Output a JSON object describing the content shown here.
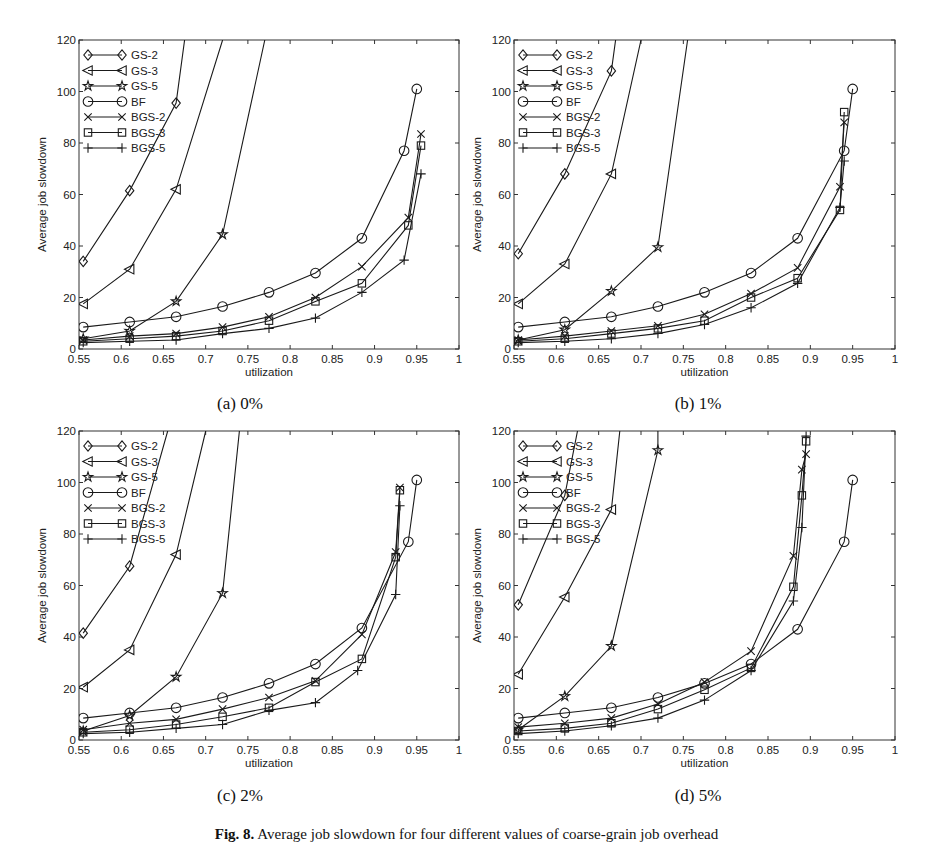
{
  "figure": {
    "caption_label": "Fig. 8.",
    "caption_text": "Average job slowdown for four different values of coarse-grain job overhead"
  },
  "chart_data": [
    {
      "type": "line",
      "panel": "a",
      "subcaption": "(a) 0%",
      "xlabel": "utilization",
      "ylabel": "Average job slowdown",
      "xlim": [
        0.55,
        1
      ],
      "ylim": [
        0,
        120
      ],
      "xticks": [
        0.55,
        0.6,
        0.65,
        0.7,
        0.75,
        0.8,
        0.85,
        0.9,
        0.95,
        1
      ],
      "yticks": [
        0,
        20,
        40,
        60,
        80,
        100,
        120
      ],
      "grid": false,
      "legend_position": "upper left",
      "series": [
        {
          "name": "GS-2",
          "marker": "diamond",
          "x": [
            0.555,
            0.61,
            0.665,
            0.675
          ],
          "y": [
            34,
            61.5,
            95.5,
            120
          ]
        },
        {
          "name": "GS-3",
          "marker": "triangle-left",
          "x": [
            0.555,
            0.61,
            0.665,
            0.72
          ],
          "y": [
            17.5,
            31,
            62,
            120
          ]
        },
        {
          "name": "GS-5",
          "marker": "star",
          "x": [
            0.555,
            0.61,
            0.665,
            0.72,
            0.77
          ],
          "y": [
            4,
            7,
            18.5,
            44.5,
            120
          ]
        },
        {
          "name": "BF",
          "marker": "circle",
          "x": [
            0.555,
            0.61,
            0.665,
            0.72,
            0.775,
            0.83,
            0.885,
            0.935,
            0.95
          ],
          "y": [
            8.5,
            10.5,
            12.5,
            16.5,
            22,
            29.5,
            43,
            77,
            101
          ]
        },
        {
          "name": "BGS-2",
          "marker": "x",
          "x": [
            0.555,
            0.61,
            0.665,
            0.72,
            0.775,
            0.83,
            0.885,
            0.94,
            0.955
          ],
          "y": [
            3.5,
            5,
            6,
            8.5,
            12.5,
            20,
            32,
            51,
            83.5
          ]
        },
        {
          "name": "BGS-3",
          "marker": "square",
          "x": [
            0.555,
            0.61,
            0.665,
            0.72,
            0.775,
            0.83,
            0.885,
            0.94,
            0.955
          ],
          "y": [
            3,
            4,
            5,
            7,
            11,
            18.5,
            25.5,
            48,
            79
          ]
        },
        {
          "name": "BGS-5",
          "marker": "plus",
          "x": [
            0.555,
            0.61,
            0.665,
            0.72,
            0.775,
            0.83,
            0.885,
            0.935,
            0.955
          ],
          "y": [
            2.5,
            3,
            3.5,
            6,
            8,
            12,
            22,
            34.5,
            68
          ]
        }
      ]
    },
    {
      "type": "line",
      "panel": "b",
      "subcaption": "(b) 1%",
      "xlabel": "utilization",
      "ylabel": "Average job slowdown",
      "xlim": [
        0.55,
        1
      ],
      "ylim": [
        0,
        120
      ],
      "xticks": [
        0.55,
        0.6,
        0.65,
        0.7,
        0.75,
        0.8,
        0.85,
        0.9,
        0.95,
        1
      ],
      "yticks": [
        0,
        20,
        40,
        60,
        80,
        100,
        120
      ],
      "grid": false,
      "legend_position": "upper left",
      "series": [
        {
          "name": "GS-2",
          "marker": "diamond",
          "x": [
            0.555,
            0.61,
            0.665,
            0.67
          ],
          "y": [
            37,
            68,
            108,
            120
          ]
        },
        {
          "name": "GS-3",
          "marker": "triangle-left",
          "x": [
            0.555,
            0.61,
            0.665,
            0.7
          ],
          "y": [
            17.5,
            33,
            68,
            120
          ]
        },
        {
          "name": "GS-5",
          "marker": "star",
          "x": [
            0.555,
            0.61,
            0.665,
            0.72,
            0.755
          ],
          "y": [
            3.5,
            7.5,
            22.5,
            39.5,
            120
          ]
        },
        {
          "name": "BF",
          "marker": "circle",
          "x": [
            0.555,
            0.61,
            0.665,
            0.72,
            0.775,
            0.83,
            0.885,
            0.94,
            0.95
          ],
          "y": [
            8.5,
            10.5,
            12.5,
            16.5,
            22,
            29.5,
            43,
            77,
            101
          ]
        },
        {
          "name": "BGS-2",
          "marker": "x",
          "x": [
            0.555,
            0.61,
            0.665,
            0.72,
            0.775,
            0.83,
            0.885,
            0.935,
            0.94
          ],
          "y": [
            3.5,
            5,
            7,
            9,
            13.5,
            21.5,
            31.5,
            63,
            88
          ]
        },
        {
          "name": "BGS-3",
          "marker": "square",
          "x": [
            0.555,
            0.61,
            0.665,
            0.72,
            0.775,
            0.83,
            0.885,
            0.935,
            0.94
          ],
          "y": [
            3,
            4,
            6,
            8,
            11,
            20,
            27.5,
            54,
            92
          ]
        },
        {
          "name": "BGS-5",
          "marker": "plus",
          "x": [
            0.555,
            0.61,
            0.665,
            0.72,
            0.775,
            0.83,
            0.885,
            0.935,
            0.94
          ],
          "y": [
            2.5,
            3,
            4,
            6,
            9.5,
            16,
            25.5,
            55,
            73
          ]
        }
      ]
    },
    {
      "type": "line",
      "panel": "c",
      "subcaption": "(c) 2%",
      "xlabel": "utilization",
      "ylabel": "Average job slowdown",
      "xlim": [
        0.55,
        1
      ],
      "ylim": [
        0,
        120
      ],
      "xticks": [
        0.55,
        0.6,
        0.65,
        0.7,
        0.75,
        0.8,
        0.85,
        0.9,
        0.95,
        1
      ],
      "yticks": [
        0,
        20,
        40,
        60,
        80,
        100,
        120
      ],
      "grid": false,
      "legend_position": "upper left",
      "series": [
        {
          "name": "GS-2",
          "marker": "diamond",
          "x": [
            0.555,
            0.61,
            0.655
          ],
          "y": [
            41.5,
            67.5,
            120
          ]
        },
        {
          "name": "GS-3",
          "marker": "triangle-left",
          "x": [
            0.555,
            0.61,
            0.665,
            0.7
          ],
          "y": [
            20.5,
            35,
            72,
            120
          ]
        },
        {
          "name": "GS-5",
          "marker": "star",
          "x": [
            0.555,
            0.61,
            0.665,
            0.72,
            0.74
          ],
          "y": [
            3.5,
            9.5,
            24.5,
            57,
            120
          ]
        },
        {
          "name": "BF",
          "marker": "circle",
          "x": [
            0.555,
            0.61,
            0.665,
            0.72,
            0.775,
            0.83,
            0.885,
            0.94,
            0.95
          ],
          "y": [
            8.5,
            10.5,
            12.5,
            16.5,
            22,
            29.5,
            43.5,
            77,
            101
          ]
        },
        {
          "name": "BGS-2",
          "marker": "x",
          "x": [
            0.555,
            0.61,
            0.665,
            0.72,
            0.775,
            0.83,
            0.885,
            0.925,
            0.93
          ],
          "y": [
            4,
            6.5,
            8,
            12,
            16.5,
            23,
            41,
            73,
            98
          ]
        },
        {
          "name": "BGS-3",
          "marker": "square",
          "x": [
            0.555,
            0.61,
            0.665,
            0.72,
            0.775,
            0.83,
            0.885,
            0.925,
            0.93
          ],
          "y": [
            3,
            4,
            6,
            9,
            12.5,
            22.5,
            31.5,
            71,
            97
          ]
        },
        {
          "name": "BGS-5",
          "marker": "plus",
          "x": [
            0.555,
            0.61,
            0.665,
            0.72,
            0.775,
            0.83,
            0.88,
            0.925,
            0.93
          ],
          "y": [
            2.5,
            3,
            4.5,
            6,
            11.5,
            14.5,
            27,
            56.5,
            91
          ]
        }
      ]
    },
    {
      "type": "line",
      "panel": "d",
      "subcaption": "(d) 5%",
      "xlabel": "utilization",
      "ylabel": "Average job slowdown",
      "xlim": [
        0.55,
        1
      ],
      "ylim": [
        0,
        120
      ],
      "xticks": [
        0.55,
        0.6,
        0.65,
        0.7,
        0.75,
        0.8,
        0.85,
        0.9,
        0.95,
        1
      ],
      "yticks": [
        0,
        20,
        40,
        60,
        80,
        100,
        120
      ],
      "grid": false,
      "legend_position": "upper left",
      "series": [
        {
          "name": "GS-2",
          "marker": "diamond",
          "x": [
            0.555,
            0.61,
            0.625
          ],
          "y": [
            52.5,
            95,
            120
          ]
        },
        {
          "name": "GS-3",
          "marker": "triangle-left",
          "x": [
            0.555,
            0.61,
            0.665,
            0.675
          ],
          "y": [
            25.5,
            55.5,
            89.5,
            120
          ]
        },
        {
          "name": "GS-5",
          "marker": "star",
          "x": [
            0.555,
            0.61,
            0.665,
            0.72,
            0.72
          ],
          "y": [
            4,
            17,
            36.5,
            112.5,
            120
          ]
        },
        {
          "name": "BF",
          "marker": "circle",
          "x": [
            0.555,
            0.61,
            0.665,
            0.72,
            0.775,
            0.83,
            0.885,
            0.94,
            0.95
          ],
          "y": [
            8.5,
            10.5,
            12.5,
            16.5,
            22,
            29.5,
            43,
            77,
            101
          ]
        },
        {
          "name": "BGS-2",
          "marker": "x",
          "x": [
            0.555,
            0.61,
            0.665,
            0.72,
            0.775,
            0.83,
            0.88,
            0.89,
            0.895
          ],
          "y": [
            5,
            6.5,
            8.5,
            14,
            22.5,
            34.5,
            71.5,
            105,
            111
          ]
        },
        {
          "name": "BGS-3",
          "marker": "square",
          "x": [
            0.555,
            0.61,
            0.665,
            0.72,
            0.775,
            0.83,
            0.88,
            0.89,
            0.895
          ],
          "y": [
            3.5,
            4.5,
            6.5,
            12,
            19.5,
            28,
            59.5,
            95,
            116
          ]
        },
        {
          "name": "BGS-5",
          "marker": "plus",
          "x": [
            0.555,
            0.61,
            0.665,
            0.72,
            0.775,
            0.83,
            0.88,
            0.89,
            0.895
          ],
          "y": [
            2.5,
            3.5,
            5.5,
            8.5,
            15.5,
            27,
            54,
            82.5,
            118
          ]
        }
      ]
    }
  ],
  "panels_layout": [
    {
      "left": 79,
      "top": 40,
      "right": 459,
      "bottom": 349,
      "cap_x": 240,
      "cap_y": 394
    },
    {
      "left": 514,
      "top": 40,
      "right": 895,
      "bottom": 349,
      "cap_x": 698,
      "cap_y": 394
    },
    {
      "left": 79,
      "top": 431,
      "right": 459,
      "bottom": 740,
      "cap_x": 240,
      "cap_y": 786
    },
    {
      "left": 514,
      "top": 431,
      "right": 895,
      "bottom": 740,
      "cap_x": 698,
      "cap_y": 786
    }
  ]
}
